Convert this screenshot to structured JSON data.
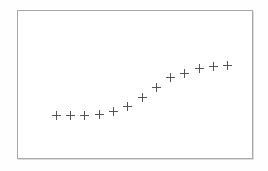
{
  "figure": {
    "background_color": "#fefefe",
    "frame": {
      "border_color": "#a8a8a8",
      "fill_color": "#ffffff",
      "x": 17,
      "y": 10,
      "width": 236,
      "height": 149
    }
  },
  "chart_data": {
    "type": "scatter",
    "title": "",
    "subtitle": "",
    "xlabel": "",
    "ylabel": "",
    "grid": false,
    "legend": null,
    "legend_position": "none",
    "marker": "plus",
    "marker_color": "#555558",
    "marker_size": 9,
    "axis_visible": false,
    "tick_labels_x": [],
    "tick_labels_y": [],
    "xlim": [
      0,
      14
    ],
    "ylim": [
      0,
      10
    ],
    "annotations": [],
    "x": [
      1,
      2,
      3,
      4,
      5,
      6,
      7,
      8,
      9,
      10,
      11,
      12,
      13
    ],
    "y": [
      2.25,
      2.25,
      2.25,
      2.3,
      2.75,
      3.3,
      4.45,
      5.6,
      6.75,
      7.25,
      7.85,
      8.15,
      8.3
    ],
    "points": [
      {
        "x": 1,
        "y": 2.25,
        "px": 47,
        "py": 126
      },
      {
        "x": 2,
        "y": 2.25,
        "px": 66,
        "py": 126
      },
      {
        "x": 3,
        "y": 2.25,
        "px": 85,
        "py": 126
      },
      {
        "x": 4,
        "y": 2.3,
        "px": 105,
        "py": 125
      },
      {
        "x": 5,
        "y": 2.75,
        "px": 124,
        "py": 121
      },
      {
        "x": 6,
        "y": 3.3,
        "px": 143,
        "py": 114
      },
      {
        "x": 7,
        "y": 4.45,
        "px": 163,
        "py": 98
      },
      {
        "x": 8,
        "y": 5.6,
        "px": 182,
        "py": 81
      },
      {
        "x": 9,
        "y": 6.75,
        "px": 201,
        "py": 70
      },
      {
        "x": 10,
        "y": 7.25,
        "px": 217,
        "py": 63
      },
      {
        "x": 11,
        "y": 7.85,
        "px": 236,
        "py": 59
      }
    ]
  }
}
